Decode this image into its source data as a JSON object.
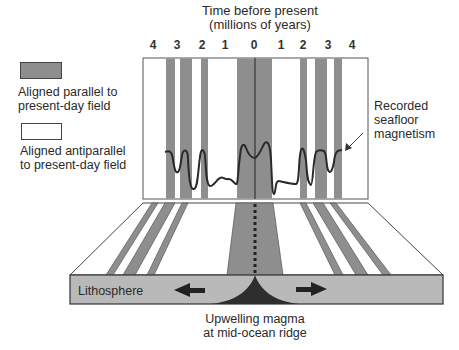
{
  "title": {
    "line1": "Time before present",
    "line2": "(millions of years)"
  },
  "time_ticks": [
    {
      "label": "4",
      "x": 153
    },
    {
      "label": "3",
      "x": 177
    },
    {
      "label": "2",
      "x": 202
    },
    {
      "label": "1",
      "x": 225
    },
    {
      "label": "0",
      "x": 254
    },
    {
      "label": "1",
      "x": 281
    },
    {
      "label": "2",
      "x": 303
    },
    {
      "label": "3",
      "x": 328
    },
    {
      "label": "4",
      "x": 352
    }
  ],
  "legend": {
    "items": [
      {
        "label_line1": "Aligned parallel to",
        "label_line2": "present-day field",
        "swatch_color": "#8e8e8e"
      },
      {
        "label_line1": "Aligned antiparallel",
        "label_line2": "to present-day field",
        "swatch_color": "#ffffff"
      }
    ]
  },
  "annotation": {
    "line1": "Recorded",
    "line2": "seafloor",
    "line3": "magnetism"
  },
  "lithosphere_label": "Lithosphere",
  "magma_label": {
    "line1": "Upwelling magma",
    "line2": "at mid-ocean ridge"
  },
  "colors": {
    "stripe": "#8e8e8e",
    "slab": "#b9b9b9",
    "magma": "#2e2e2e",
    "line": "#2a2a2a"
  }
}
